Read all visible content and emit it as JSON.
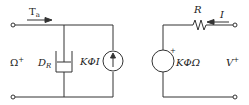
{
  "left_circuit": {
    "torque_label": "T",
    "torque_subscript": "a",
    "port_label": "Ω",
    "port_sup": "+",
    "damper_label": "D",
    "damper_subscript": "R",
    "current_source_label": "KΦI"
  },
  "right_circuit": {
    "resistor_label": "R",
    "current_label": "I",
    "voltage_source_label": "KΦΩ",
    "voltage_source_polarity": "+",
    "port_label": "V",
    "port_sup": "+"
  },
  "colors": {
    "line": "#333333",
    "background": "#ffffff"
  }
}
